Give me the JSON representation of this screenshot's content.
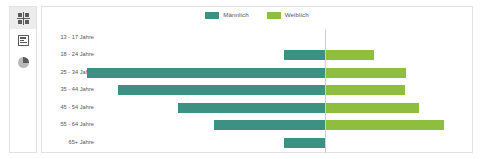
{
  "sidebar": {
    "items": [
      {
        "name": "dashboard",
        "icon": "grid-icon",
        "active": true
      },
      {
        "name": "reports",
        "icon": "bar-list-icon",
        "active": false
      },
      {
        "name": "analytics",
        "icon": "pie-chart-icon",
        "active": false
      }
    ]
  },
  "colors": {
    "male": "#3d9183",
    "female": "#8fbe3f",
    "axis": "#cfcfcf",
    "border": "#e2e2e2",
    "label": "#555555"
  },
  "chart_data": {
    "type": "bar",
    "subtype": "population-pyramid",
    "title": "",
    "xlabel": "",
    "ylabel": "",
    "grid": false,
    "legend_position": "top-center",
    "categories": [
      "13 - 17 Jahre",
      "18 - 24 Jahre",
      "25 - 34 Jahre",
      "35 - 44 Jahre",
      "45 - 54 Jahre",
      "55 - 64 Jahre",
      "65+ Jahre"
    ],
    "legend": [
      "Männlich",
      "Weiblich"
    ],
    "series": [
      {
        "name": "Männlich",
        "color": "#3d9183",
        "values": [
          0,
          41,
          238,
          207,
          147,
          111,
          41
        ]
      },
      {
        "name": "Weiblich",
        "color": "#8fbe3f",
        "values": [
          0,
          49,
          81,
          80,
          94,
          119,
          0
        ]
      }
    ],
    "xlim": [
      -250,
      250
    ],
    "units": "px-relative"
  }
}
